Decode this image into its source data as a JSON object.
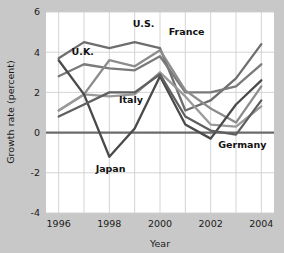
{
  "chart_data": {
    "type": "line",
    "title": "",
    "xlabel": "Year",
    "ylabel": "Growth rate (percent)",
    "x": [
      1996,
      1997,
      1998,
      1999,
      2000,
      2001,
      2002,
      2003,
      2004
    ],
    "xlim": [
      1995.5,
      2004.5
    ],
    "ylim": [
      -4,
      6
    ],
    "yticks": [
      -4,
      -2,
      0,
      2,
      4,
      6
    ],
    "ytick_labels": [
      "-4",
      "-2",
      "0",
      "2",
      "4",
      "6"
    ],
    "xticks": [
      1996,
      1998,
      2000,
      2002,
      2004
    ],
    "xtick_labels": [
      "1996",
      "1998",
      "2000",
      "2002",
      "2004"
    ],
    "grid": true,
    "grid_x_every": 1,
    "legend": "inline-labels",
    "zero_line": true,
    "series": [
      {
        "name": "U.S.",
        "label": "U.S.",
        "color": "#6e6e6e",
        "values": [
          3.7,
          4.5,
          4.2,
          4.5,
          4.2,
          1.1,
          1.6,
          2.7,
          4.4
        ]
      },
      {
        "name": "U.K.",
        "label": "U.K.",
        "color": "#7a7a7a",
        "values": [
          2.8,
          3.4,
          3.2,
          3.1,
          3.8,
          2.0,
          2.0,
          2.3,
          3.4
        ]
      },
      {
        "name": "France",
        "label": "France",
        "color": "#8c8c8c",
        "values": [
          1.1,
          1.9,
          3.6,
          3.3,
          4.1,
          2.1,
          1.2,
          0.5,
          2.3
        ]
      },
      {
        "name": "Italy",
        "label": "Italy",
        "color": "#9a9a9a",
        "values": [
          1.1,
          1.9,
          1.8,
          1.9,
          3.0,
          1.8,
          0.4,
          0.3,
          1.3
        ]
      },
      {
        "name": "Japan",
        "label": "Japan",
        "color": "#4a4a4a",
        "values": [
          3.6,
          1.9,
          -1.2,
          0.2,
          2.8,
          0.4,
          -0.3,
          1.4,
          2.6
        ]
      },
      {
        "name": "Germany",
        "label": "Germany",
        "color": "#5f5f5f",
        "values": [
          0.8,
          1.4,
          2.0,
          2.0,
          2.9,
          0.8,
          0.1,
          -0.1,
          1.6
        ]
      }
    ],
    "series_labels": [
      {
        "text": "U.S.",
        "x": 1999.35,
        "y": 5.25,
        "anchor": "middle"
      },
      {
        "text": "France",
        "x": 2001.05,
        "y": 4.85,
        "anchor": "middle"
      },
      {
        "text": "U.K.",
        "x": 1996.95,
        "y": 3.85,
        "anchor": "middle"
      },
      {
        "text": "Italy",
        "x": 1998.85,
        "y": 1.45,
        "anchor": "middle"
      },
      {
        "text": "Japan",
        "x": 1998.05,
        "y": -1.95,
        "anchor": "middle"
      },
      {
        "text": "Germany",
        "x": 2003.25,
        "y": -0.75,
        "anchor": "middle"
      }
    ]
  },
  "figure": {
    "background_color": "#c8c8c8",
    "plot_background_color": "#ffffff",
    "grid_color": "#cfcfcf",
    "zero_line_color": "#6b6b6b",
    "text_color": "#1a1a1a"
  }
}
